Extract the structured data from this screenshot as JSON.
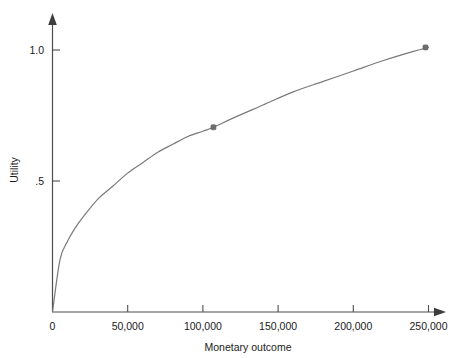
{
  "chart_data": {
    "type": "line",
    "title": "",
    "xlabel": "Monetary outcome",
    "ylabel": "Utility",
    "xlim": [
      0,
      260000
    ],
    "ylim": [
      0,
      1.12
    ],
    "grid": false,
    "legend": false,
    "x_ticks": [
      0,
      50000,
      100000,
      150000,
      200000,
      250000
    ],
    "x_tick_labels": [
      "0",
      "50,000",
      "100,000",
      "150,000",
      "200,000",
      "250,000"
    ],
    "y_ticks": [
      0,
      0.5,
      1.0
    ],
    "y_tick_labels": [
      "0",
      ".5",
      "1.0"
    ],
    "series": [
      {
        "name": "Utility curve",
        "curve_style": "concave-increasing",
        "x": [
          0,
          5000,
          10000,
          15000,
          20000,
          30000,
          40000,
          50000,
          60000,
          70000,
          80000,
          90000,
          100000,
          107000,
          120000,
          140000,
          160000,
          180000,
          200000,
          220000,
          240000,
          250000
        ],
        "y": [
          0,
          0.2,
          0.27,
          0.32,
          0.36,
          0.43,
          0.48,
          0.53,
          0.57,
          0.61,
          0.64,
          0.67,
          0.69,
          0.705,
          0.74,
          0.79,
          0.84,
          0.88,
          0.92,
          0.96,
          0.995,
          1.01
        ]
      }
    ],
    "markers": [
      {
        "x": 107000,
        "y": 0.705,
        "label": ""
      },
      {
        "x": 248000,
        "y": 1.01,
        "label": ""
      }
    ],
    "colors": {
      "curve": "#7a7a7a",
      "marker": "#6e6e6e",
      "axis": "#4d4d4d",
      "text": "#1a1a1a",
      "background": "#ffffff"
    }
  },
  "axes": {
    "x_axis_name": "x-axis",
    "y_axis_name": "y-axis"
  }
}
